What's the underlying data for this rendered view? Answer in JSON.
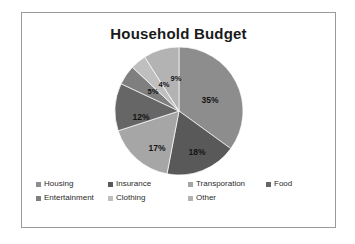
{
  "chart_data": {
    "type": "pie",
    "title": "Household Budget",
    "xlabel": "",
    "ylabel": "",
    "legend_position": "bottom",
    "grid": false,
    "categories": [
      "Housing",
      "Insurance",
      "Transporation",
      "Food",
      "Entertainment",
      "Clothing",
      "Other"
    ],
    "values": [
      35,
      18,
      17,
      12,
      5,
      4,
      9
    ],
    "value_labels": [
      "35%",
      "18%",
      "17%",
      "12%",
      "5%",
      "4%",
      "9%"
    ],
    "colors": [
      "#8d8d8d",
      "#595959",
      "#a6a6a6",
      "#666666",
      "#7f7f7f",
      "#bfbfbf",
      "#b3b3b3"
    ],
    "slices": [
      {
        "label": "Housing",
        "value": 35,
        "value_label": "35%",
        "color": "#8d8d8d",
        "start_deg": 0,
        "end_deg": 126,
        "label_x": 96,
        "label_y": 57
      },
      {
        "label": "Insurance",
        "value": 18,
        "value_label": "18%",
        "color": "#595959",
        "start_deg": 126,
        "end_deg": 190.8,
        "label_x": 83,
        "label_y": 109
      },
      {
        "label": "Transporation",
        "value": 17,
        "value_label": "17%",
        "color": "#a6a6a6",
        "start_deg": 190.8,
        "end_deg": 252,
        "label_x": 43,
        "label_y": 105
      },
      {
        "label": "Food",
        "value": 12,
        "value_label": "12%",
        "color": "#666666",
        "start_deg": 252,
        "end_deg": 295.2,
        "label_x": 27,
        "label_y": 74
      },
      {
        "label": "Entertainment",
        "value": 5,
        "value_label": "5%",
        "color": "#7f7f7f",
        "start_deg": 295.2,
        "end_deg": 313.2,
        "label_x": 39,
        "label_y": 48
      },
      {
        "label": "Clothing",
        "value": 4,
        "value_label": "4%",
        "color": "#bfbfbf",
        "start_deg": 313.2,
        "end_deg": 327.6,
        "label_x": 50,
        "label_y": 41
      },
      {
        "label": "Other",
        "value": 9,
        "value_label": "9%",
        "color": "#b3b3b3",
        "start_deg": 327.6,
        "end_deg": 360,
        "label_x": 62,
        "label_y": 35
      }
    ]
  },
  "chart": {
    "title": "Household Budget"
  },
  "legend": {
    "rows": [
      [
        {
          "label": "Housing",
          "color": "#8d8d8d",
          "width": 72
        },
        {
          "label": "Insurance",
          "color": "#595959",
          "width": 80
        },
        {
          "label": "Transporation",
          "color": "#a6a6a6",
          "width": 78
        },
        {
          "label": "Food",
          "color": "#666666",
          "width": 40
        }
      ],
      [
        {
          "label": "Entertainment",
          "color": "#7f7f7f",
          "width": 72
        },
        {
          "label": "Clothing",
          "color": "#bfbfbf",
          "width": 80
        },
        {
          "label": "Other",
          "color": "#b3b3b3",
          "width": 78
        }
      ]
    ]
  }
}
